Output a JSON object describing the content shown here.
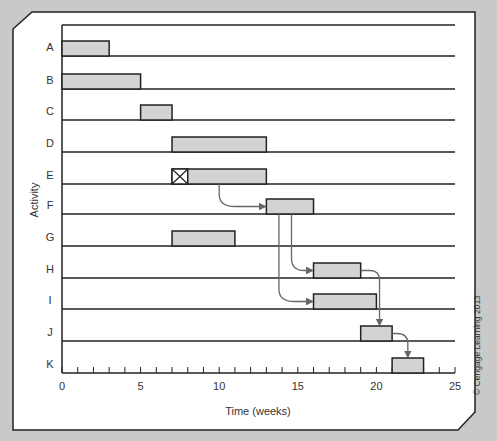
{
  "chart_data": {
    "type": "gantt",
    "title": "",
    "xlabel": "Time (weeks)",
    "ylabel": "Activity",
    "xlim": [
      0,
      25
    ],
    "xticks": [
      0,
      5,
      10,
      15,
      20,
      25
    ],
    "minor_tick_step": 1,
    "grid": "horizontal row lines",
    "bar_color": "#d3d3d3",
    "categories": [
      "A",
      "B",
      "C",
      "D",
      "E",
      "F",
      "G",
      "H",
      "I",
      "J",
      "K"
    ],
    "tasks": [
      {
        "activity": "A",
        "start": 0,
        "end": 3
      },
      {
        "activity": "B",
        "start": 0,
        "end": 5
      },
      {
        "activity": "C",
        "start": 5,
        "end": 7
      },
      {
        "activity": "D",
        "start": 7,
        "end": 13
      },
      {
        "activity": "E",
        "start": 7,
        "end": 13,
        "crossed_start": 7,
        "crossed_end": 8
      },
      {
        "activity": "F",
        "start": 13,
        "end": 16
      },
      {
        "activity": "G",
        "start": 7,
        "end": 11
      },
      {
        "activity": "H",
        "start": 16,
        "end": 19
      },
      {
        "activity": "I",
        "start": 16,
        "end": 20
      },
      {
        "activity": "J",
        "start": 19,
        "end": 21
      },
      {
        "activity": "K",
        "start": 21,
        "end": 23
      }
    ],
    "dependencies": [
      {
        "from": "E",
        "to": "F"
      },
      {
        "from": "F",
        "to": "H"
      },
      {
        "from": "F",
        "to": "I"
      },
      {
        "from": "H",
        "to": "J"
      },
      {
        "from": "J",
        "to": "K"
      }
    ]
  },
  "labels": {
    "x_axis": "Time (weeks)",
    "y_axis": "Activity",
    "copyright": "© Cengage Learning 2013"
  }
}
